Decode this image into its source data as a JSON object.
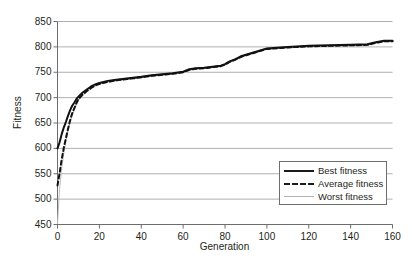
{
  "chart_data": {
    "type": "line",
    "title": "",
    "xlabel": "Generation",
    "ylabel": "Fitness",
    "xlim": [
      0,
      160
    ],
    "ylim": [
      450,
      850
    ],
    "xticks": [
      0,
      20,
      40,
      60,
      80,
      100,
      120,
      140,
      160
    ],
    "yticks": [
      450,
      500,
      550,
      600,
      650,
      700,
      750,
      800,
      850
    ],
    "grid": "horizontal",
    "legend_position": "bottom-right",
    "legend": [
      "Best fitness",
      "Average fitness",
      "Worst fitness"
    ],
    "colors": {
      "best": "#111111",
      "average": "#111111",
      "worst": "#bfbfbf",
      "grid": "#b0b0b0",
      "axis": "#6d6d6d",
      "text": "#231f20",
      "background": "#ffffff"
    },
    "x": [
      0,
      1,
      2,
      3,
      4,
      5,
      6,
      7,
      8,
      9,
      10,
      12,
      14,
      16,
      18,
      20,
      24,
      28,
      32,
      36,
      40,
      45,
      50,
      55,
      60,
      63,
      66,
      70,
      74,
      78,
      80,
      82,
      85,
      88,
      92,
      96,
      100,
      110,
      120,
      130,
      140,
      148,
      152,
      156,
      160
    ],
    "series": [
      {
        "name": "Best fitness",
        "style": "solid",
        "width": 2,
        "values": [
          600,
          612,
          628,
          641,
          652,
          664,
          675,
          684,
          690,
          697,
          702,
          710,
          716,
          722,
          726,
          729,
          733,
          735,
          737,
          739,
          741,
          744,
          746,
          748,
          751,
          756,
          758,
          759,
          761,
          763,
          766,
          771,
          776,
          782,
          787,
          792,
          797,
          800,
          802,
          803,
          804,
          805,
          809,
          812,
          812
        ]
      },
      {
        "name": "Average fitness",
        "style": "dashed",
        "width": 2,
        "values": [
          527,
          551,
          578,
          601,
          620,
          638,
          655,
          669,
          679,
          689,
          697,
          706,
          713,
          719,
          724,
          727,
          731,
          734,
          736,
          738,
          740,
          743,
          745,
          747,
          750,
          755,
          757,
          758,
          760,
          762,
          765,
          770,
          775,
          781,
          786,
          791,
          796,
          799,
          801,
          802,
          803,
          804,
          808,
          811,
          811
        ]
      },
      {
        "name": "Worst fitness",
        "style": "thin",
        "width": 1,
        "values": [
          452,
          520,
          560,
          590,
          612,
          632,
          650,
          664,
          675,
          685,
          694,
          704,
          711,
          717,
          722,
          726,
          730,
          733,
          735,
          737,
          739,
          742,
          744,
          746,
          749,
          754,
          756,
          757,
          759,
          761,
          764,
          769,
          774,
          780,
          785,
          790,
          795,
          798,
          800,
          801,
          802,
          803,
          807,
          810,
          810
        ]
      }
    ]
  }
}
